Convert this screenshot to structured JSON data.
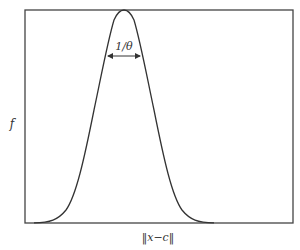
{
  "figure": {
    "ylabel": "f",
    "xlabel": "‖x−c‖",
    "annotation": "1/θ",
    "curve": "gaussian bell curve",
    "colors": {
      "line": "#333333",
      "frame": "#444444",
      "background": "#ffffff"
    }
  }
}
